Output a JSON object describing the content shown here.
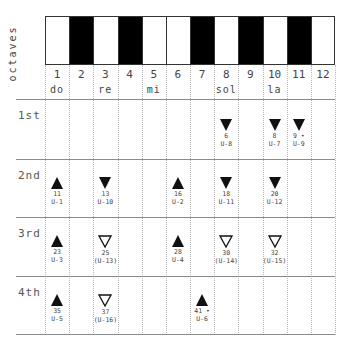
{
  "axis_label": "octaves",
  "keyboard": {
    "keys": [
      {
        "n": "1",
        "color": "white"
      },
      {
        "n": "2",
        "color": "black"
      },
      {
        "n": "3",
        "color": "white"
      },
      {
        "n": "4",
        "color": "black"
      },
      {
        "n": "5",
        "color": "white"
      },
      {
        "n": "6",
        "color": "white"
      },
      {
        "n": "7",
        "color": "black"
      },
      {
        "n": "8",
        "color": "white"
      },
      {
        "n": "9",
        "color": "black"
      },
      {
        "n": "10",
        "color": "white"
      },
      {
        "n": "11",
        "color": "black"
      },
      {
        "n": "12",
        "color": "white"
      }
    ]
  },
  "columns": [
    "1",
    "2",
    "3",
    "4",
    "5",
    "6",
    "7",
    "8",
    "9",
    "10",
    "11",
    "12"
  ],
  "solfege": [
    {
      "label": "do",
      "col": 1
    },
    {
      "label": "re",
      "col": 3
    },
    {
      "label": "mi",
      "col": 5
    },
    {
      "label": "sol",
      "col": 8
    },
    {
      "label": "la",
      "col": 10
    }
  ],
  "rows": [
    {
      "label": "1st",
      "notes": [
        {
          "col": 8,
          "dir": "down",
          "fill": "solid",
          "num": "6",
          "id": "U-8"
        },
        {
          "col": 10,
          "dir": "down",
          "fill": "solid",
          "num": "8",
          "id": "U-7"
        },
        {
          "col": 11,
          "dir": "down",
          "fill": "solid",
          "num": "9 •",
          "id": "U-9"
        }
      ]
    },
    {
      "label": "2nd",
      "notes": [
        {
          "col": 1,
          "dir": "up",
          "fill": "solid",
          "num": "11",
          "id": "U-1"
        },
        {
          "col": 3,
          "dir": "down",
          "fill": "solid",
          "num": "13",
          "id": "U-10"
        },
        {
          "col": 6,
          "dir": "up",
          "fill": "solid",
          "num": "16",
          "id": "U-2"
        },
        {
          "col": 8,
          "dir": "down",
          "fill": "solid",
          "num": "18",
          "id": "U-11"
        },
        {
          "col": 10,
          "dir": "down",
          "fill": "solid",
          "num": "20",
          "id": "U-12"
        }
      ]
    },
    {
      "label": "3rd",
      "notes": [
        {
          "col": 1,
          "dir": "up",
          "fill": "solid",
          "num": "23",
          "id": "U-3"
        },
        {
          "col": 3,
          "dir": "down",
          "fill": "outline",
          "num": "25",
          "id": "(U-13)"
        },
        {
          "col": 6,
          "dir": "up",
          "fill": "solid",
          "num": "28",
          "id": "U-4"
        },
        {
          "col": 8,
          "dir": "down",
          "fill": "outline",
          "num": "30",
          "id": "(U-14)"
        },
        {
          "col": 10,
          "dir": "down",
          "fill": "outline",
          "num": "32",
          "id": "(U-15)"
        }
      ]
    },
    {
      "label": "4th",
      "notes": [
        {
          "col": 1,
          "dir": "up",
          "fill": "solid",
          "num": "35",
          "id": "U-5"
        },
        {
          "col": 3,
          "dir": "down",
          "fill": "outline",
          "num": "37",
          "id": "(U-16)"
        },
        {
          "col": 7,
          "dir": "up",
          "fill": "solid",
          "num": "41 •",
          "id": "U-6"
        }
      ]
    }
  ]
}
